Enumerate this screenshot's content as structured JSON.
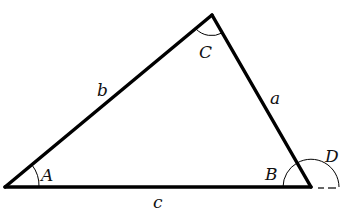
{
  "diagram": {
    "type": "triangle",
    "vertices": {
      "A": {
        "label": "A"
      },
      "B": {
        "label": "B"
      },
      "C": {
        "label": "C"
      }
    },
    "sides": {
      "a": {
        "label": "a"
      },
      "b": {
        "label": "b"
      },
      "c": {
        "label": "c"
      }
    },
    "exterior_angle": {
      "label": "D"
    },
    "colors": {
      "stroke": "#000000",
      "background": "#ffffff"
    }
  }
}
